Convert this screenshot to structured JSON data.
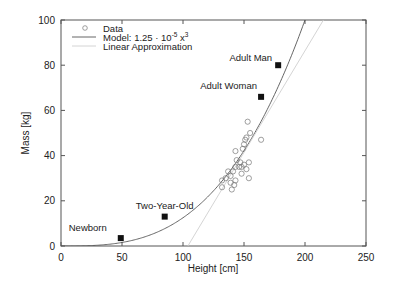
{
  "chart_data": {
    "type": "scatter",
    "title": "",
    "xlabel": "Height [cm]",
    "ylabel": "Mass [kg]",
    "xlim": [
      0,
      250
    ],
    "ylim": [
      0,
      100
    ],
    "xticks": [
      0,
      50,
      100,
      150,
      200,
      250
    ],
    "yticks": [
      0,
      20,
      40,
      60,
      80,
      100
    ],
    "grid": false,
    "legend_position": "upper left",
    "legend": [
      {
        "label": "Data",
        "marker": "circle"
      },
      {
        "label": "Model: 1.25 · 10^-5 x^3",
        "style": "line",
        "color": "#555555"
      },
      {
        "label": "Linear Approximation",
        "style": "line",
        "color": "#cccccc"
      }
    ],
    "series": [
      {
        "name": "Data",
        "type": "scatter",
        "marker": "open-circle",
        "points": [
          [
            153,
            55
          ],
          [
            155,
            50
          ],
          [
            152,
            48
          ],
          [
            151,
            47
          ],
          [
            150,
            45
          ],
          [
            164,
            47
          ],
          [
            143,
            42
          ],
          [
            149,
            43
          ],
          [
            154,
            37
          ],
          [
            147,
            37
          ],
          [
            146,
            35
          ],
          [
            148,
            35
          ],
          [
            152,
            34
          ],
          [
            150,
            36
          ],
          [
            154,
            30
          ],
          [
            148,
            32
          ],
          [
            141,
            33
          ],
          [
            139,
            31
          ],
          [
            135,
            30
          ],
          [
            139,
            28
          ],
          [
            142,
            27
          ],
          [
            140,
            25
          ],
          [
            132,
            26
          ],
          [
            144,
            38
          ],
          [
            143,
            35
          ],
          [
            143,
            29
          ],
          [
            132,
            29
          ],
          [
            137,
            33
          ]
        ]
      },
      {
        "name": "Model: 1.25 · 10^-5 x^3",
        "type": "line",
        "formula": "1.25e-5 * x^3"
      },
      {
        "name": "Linear Approximation",
        "type": "line",
        "formula": "0.9 * (x - 104)"
      },
      {
        "name": "Reference",
        "type": "scatter",
        "marker": "filled-square",
        "points": [
          {
            "label": "Newborn",
            "x": 49,
            "y": 3.5
          },
          {
            "label": "Two-Year-Old",
            "x": 85,
            "y": 13
          },
          {
            "label": "Adult Woman",
            "x": 164,
            "y": 66
          },
          {
            "label": "Adult Man",
            "x": 178,
            "y": 80
          }
        ]
      }
    ]
  }
}
